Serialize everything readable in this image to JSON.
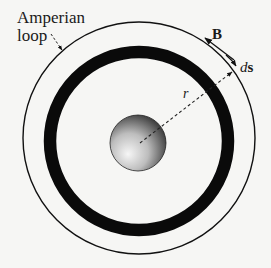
{
  "labels": {
    "amperian_line1": "Amperian",
    "amperian_line2": "loop",
    "field": "B",
    "ds_italic": "d",
    "ds_bold": "s",
    "radius": "r"
  },
  "colors": {
    "background": "#f6f6f4",
    "ink": "#111111",
    "ring": "#0a0a0a",
    "sphere_light": "#f4f4f4",
    "sphere_dark": "#2a2a2a"
  },
  "geometry": {
    "loop": {
      "cx": 139,
      "cy": 138,
      "r": 116
    },
    "ring": {
      "cx": 139,
      "cy": 141,
      "r": 89,
      "thickness": 12
    },
    "sphere": {
      "cx": 138,
      "cy": 143,
      "r": 28
    }
  }
}
